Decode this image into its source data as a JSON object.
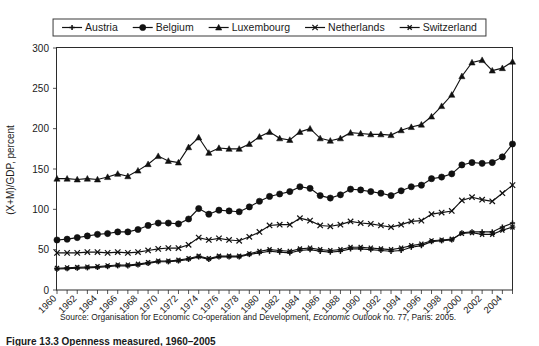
{
  "figure": {
    "caption": "Figure 13.3  Openness measured, 1960–2005",
    "source_prefix": "Source: Organisation for Economic Co-operation and Development, ",
    "source_italic": "Economic Outlook",
    "source_suffix": " no. 77, Paris: 2005."
  },
  "chart_data": {
    "type": "line",
    "title": "",
    "xlabel": "",
    "ylabel": "(X+M)/GDP, percent",
    "xlim": [
      1960,
      2005
    ],
    "ylim": [
      0,
      300
    ],
    "yticks": [
      0,
      50,
      100,
      150,
      200,
      250,
      300
    ],
    "grid": true,
    "legend_position": "top-center",
    "x": [
      1960,
      1961,
      1962,
      1963,
      1964,
      1965,
      1966,
      1967,
      1968,
      1969,
      1970,
      1971,
      1972,
      1973,
      1974,
      1975,
      1976,
      1977,
      1978,
      1979,
      1980,
      1981,
      1982,
      1983,
      1984,
      1985,
      1986,
      1987,
      1988,
      1989,
      1990,
      1991,
      1992,
      1993,
      1994,
      1995,
      1996,
      1997,
      1998,
      1999,
      2000,
      2001,
      2002,
      2003,
      2004,
      2005
    ],
    "xtick_labels": [
      "1960",
      "1962",
      "1964",
      "1966",
      "1968",
      "1970",
      "1972",
      "1974",
      "1976",
      "1978",
      "1980",
      "1982",
      "1984",
      "1986",
      "1988",
      "1990",
      "1992",
      "1994",
      "1996",
      "1998",
      "2000",
      "2002",
      "2004"
    ],
    "series": [
      {
        "name": "Austria",
        "marker": "plus",
        "values": [
          26,
          26.5,
          27,
          27.5,
          28,
          29,
          30,
          30,
          31,
          33,
          35,
          35,
          36,
          38,
          41,
          38,
          41,
          41,
          41,
          44,
          46,
          48,
          47,
          46,
          49,
          50,
          48,
          47,
          48,
          51,
          51,
          50,
          49,
          48,
          49,
          53,
          55,
          60,
          61,
          62,
          71,
          72,
          72,
          72,
          78,
          83
        ]
      },
      {
        "name": "Belgium",
        "marker": "circle",
        "values": [
          62,
          63,
          65,
          67,
          69,
          70,
          72,
          72,
          75,
          80,
          83,
          83,
          82,
          88,
          101,
          94,
          99,
          98,
          97,
          103,
          110,
          116,
          119,
          122,
          128,
          126,
          117,
          114,
          118,
          125,
          124,
          122,
          120,
          117,
          123,
          128,
          130,
          138,
          140,
          144,
          155,
          158,
          157,
          158,
          165,
          181
        ]
      },
      {
        "name": "Luxembourg",
        "marker": "triangle",
        "values": [
          138,
          138,
          137,
          138,
          137,
          140,
          144,
          141,
          148,
          156,
          166,
          160,
          158,
          177,
          189,
          170,
          176,
          175,
          175,
          181,
          190,
          196,
          188,
          186,
          196,
          200,
          188,
          185,
          188,
          195,
          194,
          193,
          193,
          192,
          198,
          202,
          205,
          215,
          228,
          242,
          265,
          282,
          285,
          272,
          275,
          283
        ]
      },
      {
        "name": "Netherlands",
        "marker": "x",
        "values": [
          46,
          46,
          46,
          47,
          47,
          46,
          47,
          46,
          47,
          49,
          51,
          52,
          52,
          56,
          65,
          62,
          64,
          62,
          61,
          66,
          72,
          80,
          81,
          81,
          89,
          86,
          80,
          79,
          81,
          85,
          83,
          82,
          80,
          78,
          81,
          85,
          86,
          94,
          96,
          98,
          111,
          115,
          112,
          110,
          120,
          130
        ]
      },
      {
        "name": "Switzerland",
        "marker": "asterisk",
        "values": [
          27,
          27.5,
          28,
          28.5,
          29,
          30,
          31,
          31,
          32,
          34,
          36,
          36,
          37,
          39,
          42,
          39,
          42,
          42,
          42,
          45,
          48,
          50,
          49,
          48,
          51,
          52,
          50,
          49,
          50,
          53,
          53,
          52,
          51,
          50,
          52,
          55,
          57,
          61,
          62,
          63,
          70,
          71,
          69,
          69,
          74,
          78
        ]
      }
    ]
  },
  "legend": {
    "items": [
      {
        "label": "Austria",
        "marker": "plus"
      },
      {
        "label": "Belgium",
        "marker": "circle"
      },
      {
        "label": "Luxembourg",
        "marker": "triangle"
      },
      {
        "label": "Netherlands",
        "marker": "x"
      },
      {
        "label": "Switzerland",
        "marker": "asterisk"
      }
    ]
  },
  "colors": {
    "line": "#111111",
    "grid": "#8a8a8a",
    "frame": "#2b2b2b",
    "text": "#1a1a1a",
    "background": "#ffffff"
  }
}
